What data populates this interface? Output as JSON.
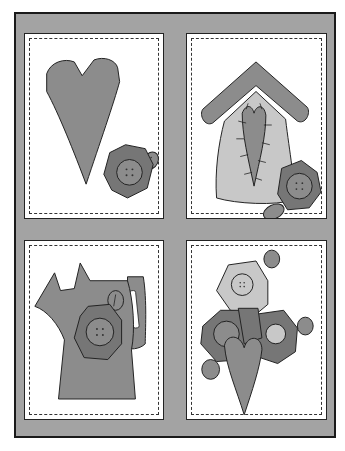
{
  "artwork": {
    "title": "",
    "colors": {
      "background_mat": "#a3a3a3",
      "frame_border": "#1a1a1a",
      "panel_fill": "#ffffff",
      "stitch_line": "#333333",
      "shape_mid": "#8c8c8c",
      "shape_dark": "#767676",
      "shape_light": "#c8c8c8",
      "outline": "#222222"
    },
    "panels": [
      {
        "id": "top-left",
        "subject": "heart with button"
      },
      {
        "id": "top-right",
        "subject": "birdhouse with stitched heart and button"
      },
      {
        "id": "bottom-left",
        "subject": "watering can with button"
      },
      {
        "id": "bottom-right",
        "subject": "button cluster with heart"
      }
    ]
  }
}
